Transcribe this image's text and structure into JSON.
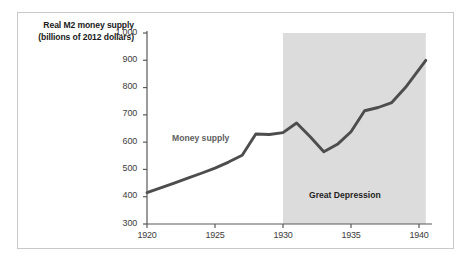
{
  "chart_data": {
    "type": "line",
    "title": "",
    "ylabel": "Real M2 money supply (billions of 2012 dollars)",
    "xlabel": "",
    "xlim": [
      1920,
      1941
    ],
    "ylim": [
      300,
      1000
    ],
    "grid": false,
    "legend": "none",
    "x_ticks": [
      "1920",
      "1925",
      "1930",
      "1935",
      "1940"
    ],
    "x_tick_values": [
      1920,
      1925,
      1930,
      1935,
      1940
    ],
    "y_ticks": [
      "300",
      "400",
      "500",
      "600",
      "700",
      "800",
      "900",
      "1,000"
    ],
    "y_tick_values": [
      300,
      400,
      500,
      600,
      700,
      800,
      900,
      1000
    ],
    "series": [
      {
        "name": "Money supply",
        "color": "#4d4d4d",
        "x": [
          1920,
          1921,
          1922,
          1923,
          1924,
          1925,
          1926,
          1927,
          1928,
          1929,
          1930,
          1931,
          1932,
          1933,
          1934,
          1935,
          1936,
          1937,
          1938,
          1939,
          1940.5
        ],
        "values": [
          415,
          432,
          450,
          468,
          486,
          505,
          527,
          552,
          630,
          628,
          635,
          670,
          620,
          565,
          592,
          638,
          715,
          727,
          745,
          800,
          900
        ]
      }
    ],
    "annotations": [
      {
        "name": "series-label",
        "text": "Money supply",
        "x": 1921.5,
        "y": 590
      },
      {
        "name": "band-label",
        "text": "Great Depression",
        "x": 1935.3,
        "y": 370
      }
    ],
    "shaded_regions": [
      {
        "name": "great-depression-band",
        "label": "Great Depression",
        "x_start": 1930,
        "x_end": 1940.5,
        "y_start": 300,
        "y_end": 1000,
        "color": "#dcdcdc"
      }
    ],
    "colors": {
      "line": "#4d4d4d",
      "axis": "#595959",
      "band": "#dcdcdc",
      "frame_border": "#c9c9c9",
      "tick_text": "#3d3d3d",
      "series_label": "#5e5e5e",
      "background": "#ffffff"
    }
  }
}
